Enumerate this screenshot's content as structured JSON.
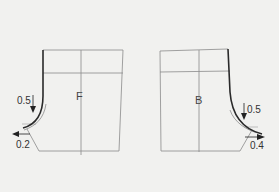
{
  "diagram": {
    "type": "pattern-draft",
    "pieces": [
      {
        "id": "front",
        "label": "F",
        "annotations": [
          {
            "value": "0.5",
            "direction": "down"
          },
          {
            "value": "0.2",
            "direction": "left"
          }
        ]
      },
      {
        "id": "back",
        "label": "B",
        "annotations": [
          {
            "value": "0.5",
            "direction": "down"
          },
          {
            "value": "0.4",
            "direction": "right"
          }
        ]
      }
    ],
    "colors": {
      "background": "#f1f1ef",
      "line_thin": "#8a8a8a",
      "line_bold": "#2a2a2a"
    }
  }
}
